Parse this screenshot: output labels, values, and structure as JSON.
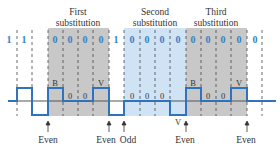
{
  "diagram": {
    "section_labels": [
      {
        "line1": "First",
        "line2": "substitution"
      },
      {
        "line1": "Second",
        "line2": "substitution"
      },
      {
        "line1": "Third",
        "line2": "substitution"
      }
    ],
    "bits": [
      "1",
      "1",
      "0",
      "0",
      "0",
      "0",
      "1",
      "0",
      "0",
      "0",
      "0",
      "0",
      "0",
      "0",
      "0",
      "0"
    ],
    "pulse_labels": [
      "B",
      "0",
      "0",
      "V",
      "0",
      "0",
      "0",
      "V",
      "B",
      "0",
      "0",
      "V"
    ],
    "parity_labels": [
      "Even",
      "Even",
      "Odd",
      "Even",
      "Even"
    ],
    "colors": {
      "signal": "#2f72c0",
      "bit_text": "#3a7fc4",
      "gray_region": "#c8c8c8",
      "blue_region": "#cfe3f5",
      "axis": "#555555"
    }
  }
}
